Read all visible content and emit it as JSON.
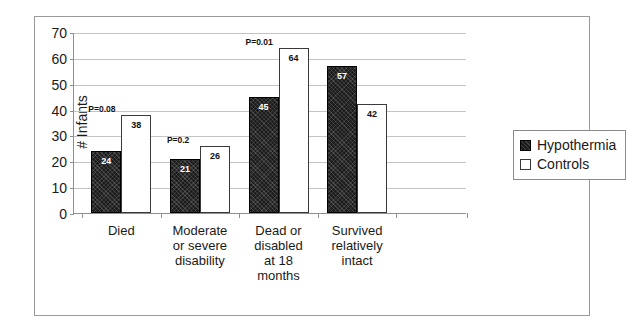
{
  "chart_data": {
    "type": "bar",
    "title": "",
    "xlabel": "",
    "ylabel": "# Infants",
    "ylim": [
      0,
      70
    ],
    "ytick_step": 10,
    "yticks": [
      "70",
      "60",
      "50",
      "40",
      "30",
      "20",
      "10",
      "0"
    ],
    "grid": true,
    "legend_position": "right",
    "categories": [
      "Died",
      "Moderate or severe disability",
      "Dead or disabled at 18 months",
      "Survived relatively intact"
    ],
    "category_lines": [
      [
        "Died"
      ],
      [
        "Moderate",
        "or severe",
        "disability"
      ],
      [
        "Dead or",
        "disabled",
        "at 18",
        "months"
      ],
      [
        "Survived",
        "relatively",
        "intact"
      ]
    ],
    "series": [
      {
        "name": "Hypothermia",
        "values": [
          24,
          21,
          45,
          57
        ],
        "color": "#1c1c1c",
        "fill": "dark"
      },
      {
        "name": "Controls",
        "values": [
          38,
          26,
          64,
          42
        ],
        "color": "#ffffff",
        "fill": "light"
      }
    ],
    "annotations": [
      {
        "category": "Died",
        "text": "P=0.08"
      },
      {
        "category": "Moderate or severe disability",
        "text": "P=0.2"
      },
      {
        "category": "Dead or disabled at 18 months",
        "text": "P=0.01"
      }
    ]
  },
  "legend": {
    "items": [
      {
        "label": "Hypothermia",
        "fill": "dark"
      },
      {
        "label": "Controls",
        "fill": "light"
      }
    ]
  }
}
